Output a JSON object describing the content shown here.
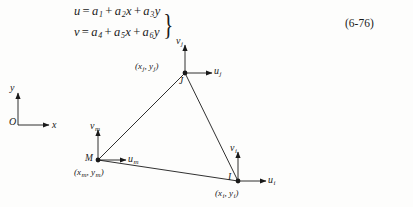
{
  "equation": {
    "line1": {
      "lhs": "u",
      "eq": "=",
      "t1": "a",
      "t1sub": "1",
      "plus1": "+",
      "t2": "a",
      "t2sub": "2",
      "t2var": "x",
      "plus2": "+",
      "t3": "a",
      "t3sub": "3",
      "t3var": "y"
    },
    "line2": {
      "lhs": "v",
      "eq": "=",
      "t1": "a",
      "t1sub": "4",
      "plus1": "+",
      "t2": "a",
      "t2sub": "5",
      "t2var": "x",
      "plus2": "+",
      "t3": "a",
      "t3sub": "6",
      "t3var": "y"
    },
    "brace": "}",
    "number": "(6-76)"
  },
  "global_axes": {
    "origin_label": "O",
    "x_label": "x",
    "y_label": "y"
  },
  "diagram": {
    "nodes": [
      {
        "id": "j",
        "label": "J",
        "coord_x": "x",
        "coord_xsub": "j",
        "coord_y": "y",
        "coord_ysub": "j",
        "coord_text": "(x",
        "u_label": "u",
        "u_sub": "j",
        "v_label": "v",
        "v_sub": "j"
      },
      {
        "id": "m",
        "label": "M",
        "coord_x": "x",
        "coord_xsub": "m",
        "coord_y": "y",
        "coord_ysub": "m",
        "u_label": "u",
        "u_sub": "m",
        "v_label": "v",
        "v_sub": "m"
      },
      {
        "id": "i",
        "label": "I",
        "coord_x": "x",
        "coord_xsub": "i",
        "coord_y": "y",
        "coord_ysub": "i",
        "u_label": "u",
        "u_sub": "i",
        "v_label": "v",
        "v_sub": "i"
      }
    ],
    "paren_open": "(",
    "paren_close": ")",
    "comma": ",",
    "colors": {
      "ink": "#1a1a1a",
      "page": "#fdfdfc"
    }
  }
}
